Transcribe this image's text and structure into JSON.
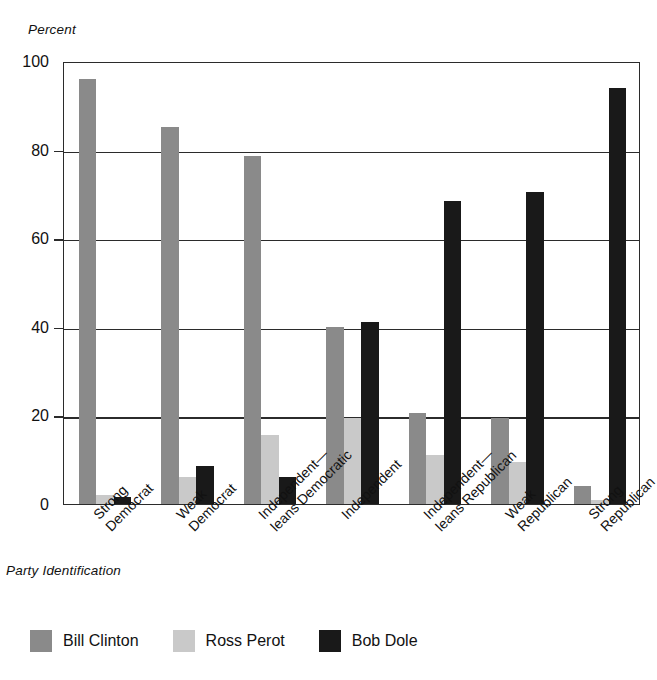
{
  "chart_data": {
    "type": "bar",
    "title": "",
    "xlabel": "Party Identification",
    "ylabel": "Percent",
    "ylim": [
      0,
      100
    ],
    "yticks": [
      0,
      20,
      40,
      60,
      80,
      100
    ],
    "grid": true,
    "legend_position": "bottom-left",
    "categories": [
      "Strong\nDemocrat",
      "Weak\nDemocrat",
      "Independent—\nleans Democratic",
      "Independent",
      "Independent—\nleans Republican",
      "Weak\nRepublican",
      "Strong\nRepublican"
    ],
    "series": [
      {
        "name": "Bill Clinton",
        "color": "#8a8a8a",
        "values": [
          96,
          85,
          78.5,
          40,
          20.5,
          19.5,
          4
        ]
      },
      {
        "name": "Ross Perot",
        "color": "#c9c9c9",
        "values": [
          2,
          6,
          15.5,
          19.5,
          11,
          9.5,
          1
        ]
      },
      {
        "name": "Bob Dole",
        "color": "#191919",
        "values": [
          1.5,
          8.5,
          6,
          41,
          68.5,
          70.5,
          94
        ]
      }
    ]
  },
  "legend": {
    "items": [
      {
        "label": "Bill Clinton",
        "color": "#8a8a8a"
      },
      {
        "label": "Ross Perot",
        "color": "#c9c9c9"
      },
      {
        "label": "Bob Dole",
        "color": "#191919"
      }
    ]
  },
  "axes": {
    "y_title": "Percent",
    "x_title": "Party Identification",
    "y_tick_labels": [
      "0",
      "20",
      "40",
      "60",
      "80",
      "100"
    ]
  }
}
